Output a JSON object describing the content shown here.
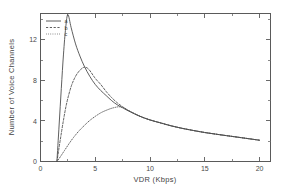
{
  "chart_data": {
    "type": "line",
    "title": "",
    "xlabel": "VDR (Kbps)",
    "ylabel": "Number of Voice Channels",
    "xlim": [
      0,
      21
    ],
    "ylim": [
      0,
      14.6
    ],
    "xticks": [
      0,
      5,
      10,
      15,
      20
    ],
    "xticklabels": [
      "0",
      "5",
      "10",
      "15",
      "20"
    ],
    "yticks": [
      0,
      4,
      8,
      12
    ],
    "yticklabels": [
      "0",
      "4",
      "8",
      "12"
    ],
    "grid": false,
    "legend_position": "upper-left",
    "legend_entries": [
      {
        "label": "a",
        "style": "solid"
      },
      {
        "label": "b",
        "style": "dashed"
      },
      {
        "label": "c",
        "style": "dotted"
      }
    ],
    "series": [
      {
        "name": "a",
        "style": "solid",
        "x": [
          1.5,
          1.7,
          1.9,
          2.1,
          2.3,
          2.5,
          2.8,
          3.2,
          3.6,
          4.0,
          4.5,
          5.0,
          5.5,
          6.0,
          6.5,
          7.0,
          7.5,
          8.0,
          9.0,
          10.0,
          11.0,
          12.0,
          13.0,
          14.0,
          15.0,
          16.0,
          17.0,
          18.0,
          19.0,
          20.0
        ],
        "y": [
          0.0,
          3.6,
          7.2,
          10.6,
          13.2,
          14.5,
          13.2,
          11.6,
          10.4,
          9.4,
          8.4,
          7.6,
          7.0,
          6.5,
          6.0,
          5.6,
          5.3,
          5.0,
          4.5,
          4.1,
          3.8,
          3.5,
          3.25,
          3.05,
          2.85,
          2.7,
          2.55,
          2.4,
          2.25,
          2.1
        ]
      },
      {
        "name": "b",
        "style": "dashed",
        "x": [
          1.5,
          1.8,
          2.1,
          2.4,
          2.8,
          3.2,
          3.6,
          4.0,
          4.4,
          5.0,
          5.5,
          6.0,
          6.5,
          7.0,
          7.5,
          8.0,
          9.0,
          10.0,
          12.0,
          14.0,
          16.0,
          18.0,
          20.0
        ],
        "y": [
          0.0,
          2.1,
          4.1,
          5.8,
          7.4,
          8.4,
          9.0,
          9.3,
          9.1,
          8.2,
          7.6,
          6.9,
          6.3,
          5.8,
          5.4,
          5.05,
          4.5,
          4.1,
          3.5,
          3.05,
          2.7,
          2.4,
          2.1
        ]
      },
      {
        "name": "c",
        "style": "dotted",
        "x": [
          1.5,
          1.8,
          2.2,
          2.6,
          3.0,
          3.5,
          4.0,
          4.5,
          5.0,
          5.5,
          6.0,
          6.5,
          7.0,
          7.2,
          7.6,
          8.0,
          9.0,
          10.0,
          11.0,
          12.0,
          14.0,
          16.0,
          18.0,
          20.0
        ],
        "y": [
          0.0,
          0.45,
          1.1,
          1.75,
          2.35,
          3.0,
          3.55,
          4.05,
          4.45,
          4.8,
          5.05,
          5.25,
          5.38,
          5.4,
          5.3,
          5.05,
          4.5,
          4.1,
          3.8,
          3.5,
          3.05,
          2.7,
          2.4,
          2.1
        ]
      }
    ]
  }
}
